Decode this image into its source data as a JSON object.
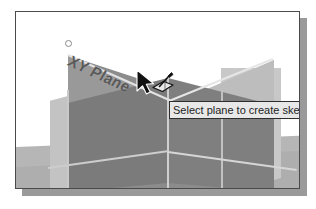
{
  "figure": {
    "kind": "cad-viewport-screenshot",
    "frame_border_color": "#4a4a4a",
    "background_color": "#ffffff",
    "shadow_color": "#9a9a9a"
  },
  "viewport": {
    "plane_label": "XY Plane",
    "plane_label_color": "#595959",
    "planes": [
      {
        "name": "xy-plane-highlighted",
        "color": "#8c8c8c"
      },
      {
        "name": "left-plane",
        "color": "#c3c3c3"
      },
      {
        "name": "right-plane",
        "color": "#c8c8c8"
      },
      {
        "name": "ground-plane",
        "color": "#b6b6b6"
      }
    ],
    "vertex_marker": "origin-vertex"
  },
  "tooltip": {
    "text": "Select plane to create sketch or",
    "background_color": "#e8e8e8",
    "border_color": "#2e2e2e",
    "text_color": "#1f1f1f"
  },
  "cursor": {
    "type": "arrow-with-sketch-plane-icon",
    "color": "#1a1a1a"
  }
}
